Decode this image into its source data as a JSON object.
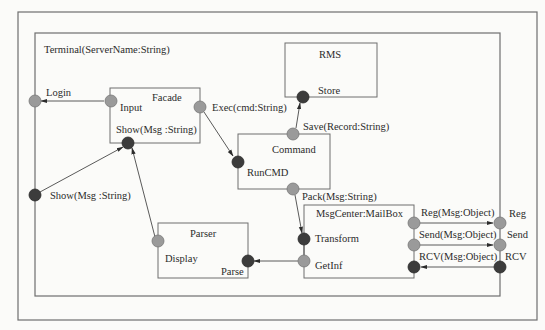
{
  "diagram": {
    "terminal": {
      "label": "Terminal(ServerName:String)",
      "ports": {
        "login": "Login",
        "show": "Show(Msg :String)",
        "reg": "Reg",
        "send": "Send",
        "rcv": "RCV"
      }
    },
    "components": {
      "facade": {
        "title": "Facade",
        "input": "Input",
        "show": "Show(Msg :String)",
        "exec": "Exec(cmd:String)"
      },
      "rms": {
        "title": "RMS",
        "store": "Store"
      },
      "command": {
        "title": "Command",
        "run": "RunCMD",
        "save": "Save(Record:String)",
        "pack": "Pack(Msg:String)"
      },
      "parser": {
        "title": "Parser",
        "display": "Display",
        "parse": "Parse"
      },
      "msgcenter": {
        "title": "MsgCenter:MailBox",
        "transform": "Transform",
        "getinf": "GetInf",
        "reg": "Reg(Msg:Object)",
        "send": "Send(Msg:Object)",
        "rcv": "RCV(Msg:Object)"
      }
    },
    "colors": {
      "port_provided": "#9a9a9a",
      "port_required": "#3c3c3c",
      "line": "#5a5a5a"
    }
  }
}
